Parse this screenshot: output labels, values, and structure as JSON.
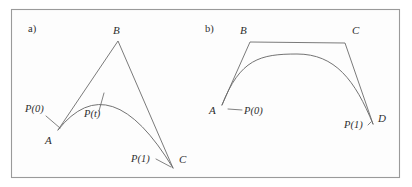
{
  "figure": {
    "caption_panels": [
      {
        "id": "a",
        "label": "a)",
        "x": 28,
        "y": 32
      },
      {
        "id": "b",
        "label": "b)",
        "x": 205,
        "y": 32
      }
    ],
    "colors": {
      "stroke": "#6b6b6b",
      "frame": "#9a9a9a",
      "background": "#fdfdfd",
      "text": "#2e2e2e"
    },
    "frame": {
      "x": 11,
      "y": 9,
      "width": 389,
      "height": 169
    }
  },
  "panel_a": {
    "title": "a)",
    "description": "Quadratic Bezier curve with control polygon A-B-C",
    "points": {
      "A": {
        "label": "A",
        "x": 58,
        "y": 130,
        "label_x": 45,
        "label_y": 144
      },
      "B": {
        "label": "B",
        "x": 118,
        "y": 41,
        "label_x": 113,
        "label_y": 34
      },
      "C": {
        "label": "C",
        "x": 173,
        "y": 168,
        "label_x": 179,
        "label_y": 163
      }
    },
    "annotations": {
      "p0": {
        "label": "P(0)",
        "x": 25,
        "y": 112
      },
      "pt": {
        "label": "P(t)",
        "x": 84,
        "y": 117
      },
      "p1": {
        "label": "P(1)",
        "x": 131,
        "y": 162
      }
    },
    "control_polygon": "M58,130 L118,41 L173,168",
    "curve_path": "M58,130 Q110,64 173,168",
    "leaders": [
      "M46,116 L60,128",
      "M99,111 L104,93",
      "M156,159 L171,167"
    ]
  },
  "panel_b": {
    "title": "b)",
    "description": "Cubic Bezier curve with control polygon A-B-C-D",
    "points": {
      "A": {
        "label": "A",
        "x": 222,
        "y": 105,
        "label_x": 209,
        "label_y": 114
      },
      "B": {
        "label": "B",
        "x": 250,
        "y": 42,
        "label_x": 240,
        "label_y": 34
      },
      "C": {
        "label": "C",
        "x": 345,
        "y": 43,
        "label_x": 352,
        "label_y": 34
      },
      "D": {
        "label": "D",
        "x": 373,
        "y": 124,
        "label_x": 378,
        "label_y": 122
      }
    },
    "annotations": {
      "p0": {
        "label": "P(0)",
        "x": 244,
        "y": 114
      },
      "p1": {
        "label": "P(1)",
        "x": 344,
        "y": 128
      }
    },
    "control_polygon": "M222,105 L250,42 L345,43 L373,124",
    "curve_path": "M222,105 C240,59 260,54 297,54 C335,54 355,80 373,124",
    "leaders": [
      "M228,109 L242,110",
      "M368,125 L371,122"
    ]
  },
  "chart_data": {
    "type": "line",
    "xlabel": "",
    "ylabel": "",
    "series": [
      {
        "name": "panel-a-control-polygon",
        "points": [
          [
            58,
            130
          ],
          [
            118,
            41
          ],
          [
            173,
            168
          ]
        ]
      },
      {
        "name": "panel-a-quadratic-bezier",
        "points": [
          [
            58,
            130
          ],
          [
            110,
            64
          ],
          [
            173,
            168
          ]
        ]
      },
      {
        "name": "panel-b-control-polygon",
        "points": [
          [
            222,
            105
          ],
          [
            250,
            42
          ],
          [
            345,
            43
          ],
          [
            373,
            124
          ]
        ]
      },
      {
        "name": "panel-b-cubic-bezier",
        "points": [
          [
            222,
            105
          ],
          [
            250,
            42
          ],
          [
            345,
            43
          ],
          [
            373,
            124
          ]
        ]
      }
    ],
    "annotations": [
      "a)",
      "A",
      "B",
      "C",
      "P(0)",
      "P(t)",
      "P(1)",
      "b)",
      "A",
      "B",
      "C",
      "D",
      "P(0)",
      "P(1)"
    ]
  }
}
